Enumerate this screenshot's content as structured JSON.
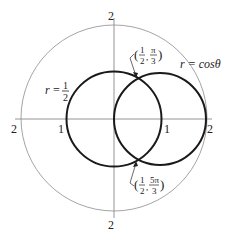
{
  "diagram": {
    "title": "",
    "colors": {
      "curve": "#1a1a1a",
      "axis": "#888888",
      "outer": "#999999",
      "text": "#222222"
    },
    "axis_labels": {
      "top": "2",
      "bottom": "2",
      "left": "2",
      "right": "2",
      "left_one": "1",
      "right_one": "1"
    },
    "curves": [
      {
        "name": "r = 1/2",
        "label_r": "r",
        "label_eq": "=",
        "label_num": "1",
        "label_den": "2"
      },
      {
        "name": "r = cos θ",
        "label": "r = cosθ"
      }
    ],
    "points": [
      {
        "name": "(1/2, π/3)",
        "num1": "1",
        "den1": "2",
        "num2": "π",
        "den2": "3"
      },
      {
        "name": "(1/2, 5π/3)",
        "num1": "1",
        "den1": "2",
        "num2": "5π",
        "den2": "3"
      }
    ]
  }
}
